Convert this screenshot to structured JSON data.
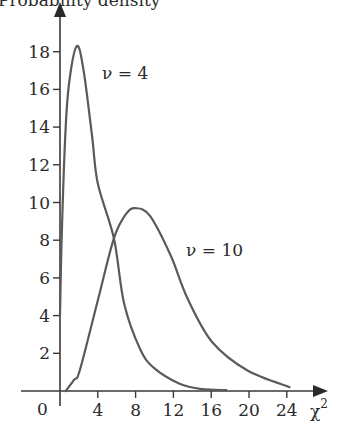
{
  "chart_data": {
    "type": "line",
    "title": "",
    "ylabel": "Probability density",
    "xlabel": "χ²",
    "xlabel_base": "χ",
    "xlabel_sup": "2",
    "origin_label": "0",
    "xlim": [
      0,
      26
    ],
    "ylim": [
      0,
      20
    ],
    "grid": false,
    "legend": "inline labels",
    "x_ticks": [
      4,
      8,
      12,
      16,
      20,
      24
    ],
    "x_tick_labels": [
      "4",
      "8",
      "12",
      "16",
      "20",
      "24"
    ],
    "y_ticks": [
      2,
      4,
      6,
      8,
      10,
      12,
      14,
      16,
      18
    ],
    "y_tick_labels": [
      "2",
      "4",
      "6",
      "8",
      "10",
      "12",
      "14",
      "16",
      "18"
    ],
    "series": [
      {
        "name": "ν = 4",
        "label": "ν = 4",
        "color": "#5a5a5a",
        "x": [
          0,
          0.2,
          0.6,
          1.0,
          1.8,
          2.5,
          3.4,
          4.0,
          5.7,
          6.8,
          8.5,
          10.0,
          12.6,
          15.0,
          17.6
        ],
        "y": [
          4.0,
          8.5,
          14.0,
          16.5,
          18.3,
          17.0,
          13.5,
          11.0,
          8.1,
          4.6,
          2.2,
          1.2,
          0.4,
          0.1,
          0.05
        ]
      },
      {
        "name": "ν = 10",
        "label": "ν = 10",
        "color": "#5a5a5a",
        "x": [
          0.6,
          1.5,
          2.1,
          4.0,
          5.7,
          7.0,
          8.0,
          9.5,
          11.7,
          13.5,
          16.1,
          19.8,
          24.3
        ],
        "y": [
          0.0,
          0.6,
          1.1,
          4.8,
          8.1,
          9.4,
          9.7,
          9.3,
          7.2,
          4.9,
          2.6,
          1.1,
          0.2
        ]
      }
    ]
  }
}
